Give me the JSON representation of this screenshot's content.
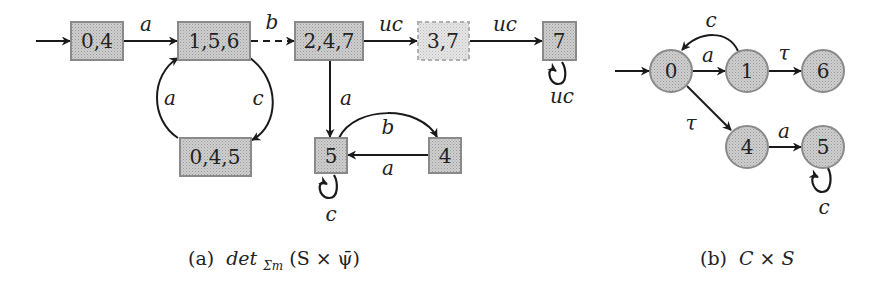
{
  "colors": {
    "node_fill": "#c4c4c4",
    "node_border": "#7a7a7a",
    "faded_node_fill": "#dedede",
    "faded_node_border": "#a8a8a8",
    "edge": "#1a1a1a",
    "text": "#222222"
  },
  "diagram_a": {
    "caption_prefix": "(a)",
    "caption_math": "det",
    "caption_subscript": "Σm",
    "caption_rest": "(S × ψ̄)",
    "nodes": [
      {
        "id": "n04",
        "label": "0,4",
        "initial": true
      },
      {
        "id": "n156",
        "label": "1,5,6"
      },
      {
        "id": "n247",
        "label": "2,4,7"
      },
      {
        "id": "n37",
        "label": "3,7",
        "style": "faded-dashed"
      },
      {
        "id": "n7",
        "label": "7"
      },
      {
        "id": "n045",
        "label": "0,4,5"
      },
      {
        "id": "n5",
        "label": "5"
      },
      {
        "id": "n4",
        "label": "4"
      }
    ],
    "edges": [
      {
        "from": "n04",
        "to": "n156",
        "label": "a"
      },
      {
        "from": "n156",
        "to": "n247",
        "label": "b",
        "style": "dashed"
      },
      {
        "from": "n247",
        "to": "n37",
        "label": "uc"
      },
      {
        "from": "n37",
        "to": "n7",
        "label": "uc"
      },
      {
        "from": "n7",
        "to": "n7",
        "label": "uc"
      },
      {
        "from": "n156",
        "to": "n045",
        "label": "c"
      },
      {
        "from": "n045",
        "to": "n156",
        "label": "a"
      },
      {
        "from": "n247",
        "to": "n5",
        "label": "a"
      },
      {
        "from": "n5",
        "to": "n4",
        "label": "b"
      },
      {
        "from": "n4",
        "to": "n5",
        "label": "a"
      },
      {
        "from": "n5",
        "to": "n5",
        "label": "c"
      }
    ]
  },
  "diagram_b": {
    "caption_prefix": "(b)",
    "caption_math": "C × S",
    "nodes": [
      {
        "id": "c0",
        "label": "0",
        "initial": true
      },
      {
        "id": "c1",
        "label": "1"
      },
      {
        "id": "c6",
        "label": "6"
      },
      {
        "id": "c4",
        "label": "4"
      },
      {
        "id": "c5",
        "label": "5"
      }
    ],
    "edges": [
      {
        "from": "c0",
        "to": "c1",
        "label": "a"
      },
      {
        "from": "c1",
        "to": "c0",
        "label": "c"
      },
      {
        "from": "c1",
        "to": "c6",
        "label": "τ"
      },
      {
        "from": "c0",
        "to": "c4",
        "label": "τ"
      },
      {
        "from": "c4",
        "to": "c5",
        "label": "a"
      },
      {
        "from": "c5",
        "to": "c5",
        "label": "c"
      }
    ]
  }
}
